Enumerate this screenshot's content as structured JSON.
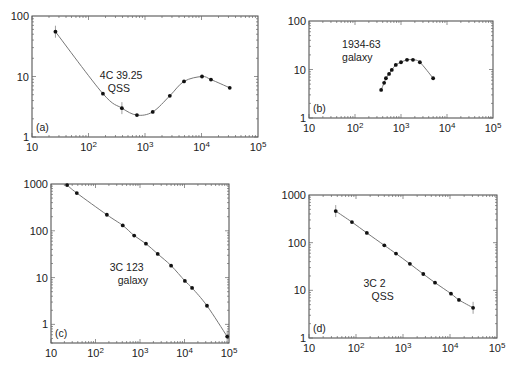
{
  "chart_data": [
    {
      "type": "line",
      "panel_label": "(a)",
      "annotation": [
        "4C 39.25",
        "QSS"
      ],
      "xscale": "log",
      "yscale": "log",
      "xlim": [
        10,
        100000
      ],
      "ylim": [
        1,
        100
      ],
      "xticks": [
        {
          "base": "10",
          "exp": ""
        },
        {
          "base": "10",
          "exp": "2"
        },
        {
          "base": "10",
          "exp": "3"
        },
        {
          "base": "10",
          "exp": "4"
        },
        {
          "base": "10",
          "exp": "5"
        }
      ],
      "yticks": [
        "1",
        "10",
        "100"
      ],
      "x": [
        26,
        180,
        390,
        720,
        1370,
        2750,
        4900,
        10200,
        14700,
        31600
      ],
      "y": [
        55,
        5.2,
        3.0,
        2.3,
        2.6,
        4.8,
        8.3,
        10,
        8.9,
        6.5
      ],
      "error_bars_on": [
        0,
        2
      ]
    },
    {
      "type": "line",
      "panel_label": "(b)",
      "annotation": [
        "1934-63",
        "galaxy"
      ],
      "xscale": "log",
      "yscale": "log",
      "xlim": [
        10,
        100000
      ],
      "ylim": [
        1,
        100
      ],
      "xticks": [
        {
          "base": "10",
          "exp": ""
        },
        {
          "base": "10",
          "exp": "2"
        },
        {
          "base": "10",
          "exp": "3"
        },
        {
          "base": "10",
          "exp": "4"
        },
        {
          "base": "10",
          "exp": "5"
        }
      ],
      "yticks": [
        "1",
        "10",
        "100"
      ],
      "x": [
        370,
        430,
        470,
        550,
        630,
        770,
        1000,
        1350,
        1820,
        2570,
        5000
      ],
      "y": [
        3.8,
        5.3,
        6.6,
        8.1,
        9.8,
        12.4,
        14.1,
        15.8,
        15.8,
        14.1,
        6.6
      ],
      "error_bars_on": []
    },
    {
      "type": "line",
      "panel_label": "(c)",
      "annotation": [
        "3C 123",
        "galaxy"
      ],
      "xscale": "log",
      "yscale": "log",
      "xlim": [
        10,
        100000
      ],
      "ylim": [
        0.4,
        1000
      ],
      "xticks": [
        {
          "base": "10",
          "exp": ""
        },
        {
          "base": "10",
          "exp": "2"
        },
        {
          "base": "10",
          "exp": "3"
        },
        {
          "base": "10",
          "exp": "4"
        },
        {
          "base": "10",
          "exp": "5"
        }
      ],
      "yticks": [
        "1",
        "10",
        "100",
        "1000"
      ],
      "x": [
        23,
        38,
        180,
        410,
        740,
        1360,
        2500,
        5000,
        10200,
        14800,
        32000,
        91000
      ],
      "y": [
        950,
        640,
        220,
        130,
        79,
        53,
        32,
        18,
        8.5,
        6.0,
        2.5,
        0.55
      ],
      "error_bars_on": [
        11
      ]
    },
    {
      "type": "line",
      "panel_label": "(d)",
      "annotation": [
        "3C 2",
        "QSS"
      ],
      "xscale": "log",
      "yscale": "log",
      "xlim": [
        10,
        100000
      ],
      "ylim": [
        1,
        1000
      ],
      "xticks": [
        {
          "base": "10",
          "exp": ""
        },
        {
          "base": "10",
          "exp": "2"
        },
        {
          "base": "10",
          "exp": "3"
        },
        {
          "base": "10",
          "exp": "4"
        },
        {
          "base": "10",
          "exp": "5"
        }
      ],
      "yticks": [
        "1",
        "10",
        "100",
        "1000"
      ],
      "x": [
        37,
        82,
        170,
        400,
        710,
        1400,
        2700,
        4800,
        10500,
        15500,
        31000
      ],
      "y": [
        460,
        270,
        160,
        88,
        59,
        36,
        22,
        14.5,
        8.5,
        6.3,
        4.3
      ],
      "error_bars_on": [
        0,
        10
      ]
    }
  ]
}
